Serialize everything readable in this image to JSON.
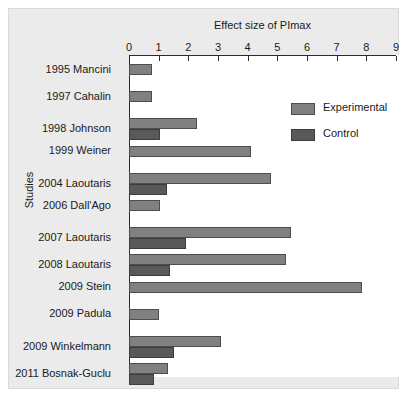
{
  "chart_data": {
    "type": "bar",
    "orientation": "horizontal",
    "title": "Effect size of PImax",
    "xlabel": "Effect size of PImax",
    "ylabel": "Studies",
    "xlim": [
      0,
      9
    ],
    "xticks": [
      0,
      1,
      2,
      3,
      4,
      5,
      6,
      7,
      8,
      9
    ],
    "grid": false,
    "legend_position": "upper-right-inside",
    "categories": [
      "1995 Mancini",
      "1997 Cahalin",
      "1998 Johnson",
      "1999 Weiner",
      "2004 Laoutaris",
      "2006 Dall'Ago",
      "2007 Laoutaris",
      "2008 Laoutaris",
      "2009 Stein",
      "2009 Padula",
      "2009 Winkelmann",
      "2011 Bosnak-Guclu"
    ],
    "series": [
      {
        "name": "Experimental",
        "color": "#808080",
        "values": [
          0.78,
          0.78,
          2.3,
          4.1,
          4.8,
          1.05,
          5.45,
          5.3,
          7.85,
          1.0,
          3.1,
          1.3
        ]
      },
      {
        "name": "Control",
        "color": "#595959",
        "values": [
          0,
          0,
          1.05,
          0,
          1.28,
          0,
          1.92,
          1.38,
          0,
          0,
          1.5,
          0.85
        ]
      }
    ]
  },
  "legend": {
    "items": [
      {
        "label": "Experimental",
        "color": "#808080"
      },
      {
        "label": "Control",
        "color": "#595959"
      }
    ]
  },
  "axis": {
    "title": "Effect size of PImax",
    "y_caption": "Studies",
    "tick_labels": [
      "0",
      "1",
      "2",
      "3",
      "4",
      "5",
      "6",
      "7",
      "8",
      "9"
    ]
  }
}
